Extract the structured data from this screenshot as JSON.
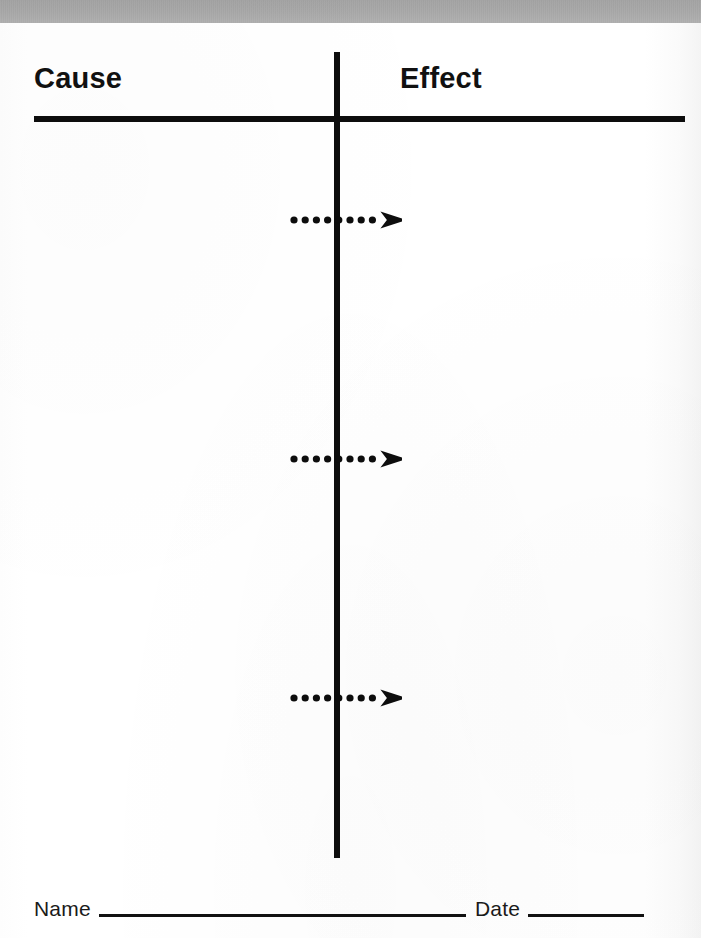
{
  "document": {
    "type": "worksheet",
    "title_partial": "Cause & Effect Chart",
    "header_band_color": "#a9a9a9"
  },
  "header": {
    "title": "Cause & Effect Chart"
  },
  "columns": {
    "left": {
      "label": "Cause"
    },
    "right": {
      "label": "Effect"
    }
  },
  "divider": {
    "horizontal_rule_color": "#0d0d0d",
    "vertical_rule_color": "#0d0d0d"
  },
  "arrows": [
    {
      "id": "arrow-1",
      "name": "dotted-arrow-1",
      "top": 208,
      "dots": 8,
      "direction": "right"
    },
    {
      "id": "arrow-2",
      "name": "dotted-arrow-2",
      "top": 447,
      "dots": 8,
      "direction": "right"
    },
    {
      "id": "arrow-3",
      "name": "dotted-arrow-3",
      "top": 686,
      "dots": 8,
      "direction": "right"
    }
  ],
  "footer": {
    "name_label": "Name",
    "date_label": "Date"
  }
}
